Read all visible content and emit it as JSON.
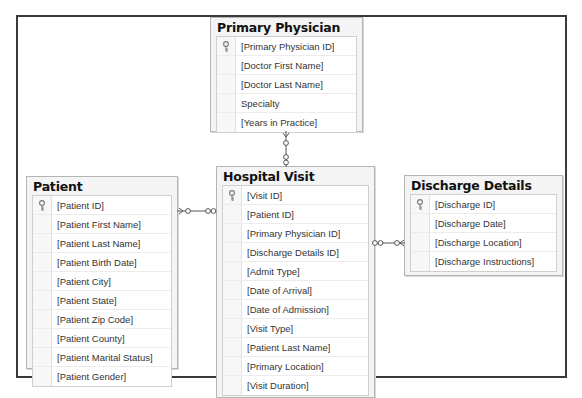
{
  "diagram": {
    "type": "entity-relationship",
    "tables": [
      {
        "name": "Primary Physician",
        "columns": [
          {
            "label": "[Primary Physician ID]",
            "primary_key": true
          },
          {
            "label": "[Doctor First Name]",
            "primary_key": false
          },
          {
            "label": "[Doctor Last Name]",
            "primary_key": false
          },
          {
            "label": "Specialty",
            "primary_key": false
          },
          {
            "label": "[Years in Practice]",
            "primary_key": false
          }
        ]
      },
      {
        "name": "Patient",
        "columns": [
          {
            "label": "[Patient ID]",
            "primary_key": true
          },
          {
            "label": "[Patient First Name]",
            "primary_key": false
          },
          {
            "label": "[Patient Last Name]",
            "primary_key": false
          },
          {
            "label": "[Patient Birth Date]",
            "primary_key": false
          },
          {
            "label": "[Patient City]",
            "primary_key": false
          },
          {
            "label": "[Patient State]",
            "primary_key": false
          },
          {
            "label": "[Patient Zip Code]",
            "primary_key": false
          },
          {
            "label": "[Patient County]",
            "primary_key": false
          },
          {
            "label": "[Patient Marital Status]",
            "primary_key": false
          },
          {
            "label": "[Patient Gender]",
            "primary_key": false
          }
        ]
      },
      {
        "name": "Hospital Visit",
        "columns": [
          {
            "label": "[Visit ID]",
            "primary_key": true
          },
          {
            "label": "[Patient ID]",
            "primary_key": false
          },
          {
            "label": "[Primary Physician ID]",
            "primary_key": false
          },
          {
            "label": "[Discharge Details ID]",
            "primary_key": false
          },
          {
            "label": "[Admit Type]",
            "primary_key": false
          },
          {
            "label": "[Date of Arrival]",
            "primary_key": false
          },
          {
            "label": "[Date of Admission]",
            "primary_key": false
          },
          {
            "label": "[Visit Type]",
            "primary_key": false
          },
          {
            "label": "[Patient Last Name]",
            "primary_key": false
          },
          {
            "label": "[Primary Location]",
            "primary_key": false
          },
          {
            "label": "[Visit Duration]",
            "primary_key": false
          }
        ]
      },
      {
        "name": "Discharge Details",
        "columns": [
          {
            "label": "[Discharge ID]",
            "primary_key": true
          },
          {
            "label": "[Discharge Date]",
            "primary_key": false
          },
          {
            "label": "[Discharge Location]",
            "primary_key": false
          },
          {
            "label": "[Discharge Instructions]",
            "primary_key": false
          }
        ]
      }
    ],
    "relationships": [
      {
        "from": "Primary Physician",
        "to": "Hospital Visit",
        "cardinality": "one-to-many"
      },
      {
        "from": "Patient",
        "to": "Hospital Visit",
        "cardinality": "one-to-many"
      },
      {
        "from": "Discharge Details",
        "to": "Hospital Visit",
        "cardinality": "one-to-many"
      }
    ],
    "colors": {
      "frame_border": "#3a3a3a",
      "table_bg": "#f4f4f4",
      "table_border": "#b5b5b5",
      "row_bg": "#ffffff",
      "title_text": "#111111",
      "column_text": "#333333"
    }
  }
}
